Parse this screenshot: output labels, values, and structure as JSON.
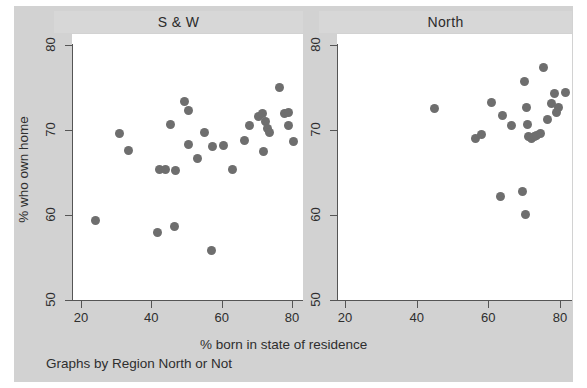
{
  "chart_data": {
    "type": "scatter",
    "title": "",
    "xlabel": "% born in state of residence",
    "ylabel": "% who own home",
    "note": "Graphs by Region North or Not",
    "xlim": [
      15,
      85
    ],
    "ylim": [
      47.5,
      82.5
    ],
    "xticks": [
      20,
      40,
      60,
      80
    ],
    "yticks": [
      50,
      60,
      70,
      80
    ],
    "grid": false,
    "legend": "none",
    "marker_color": "#6e6e6e",
    "panel_header_color": "#d7d7d7",
    "background_color": "#d2d2d2",
    "panels": [
      {
        "label": "S & W",
        "points": [
          {
            "x": 24.2,
            "y": 59.3
          },
          {
            "x": 31.0,
            "y": 69.6
          },
          {
            "x": 33.5,
            "y": 67.6
          },
          {
            "x": 41.8,
            "y": 58.0
          },
          {
            "x": 42.3,
            "y": 65.4
          },
          {
            "x": 44.0,
            "y": 65.4
          },
          {
            "x": 45.5,
            "y": 70.7
          },
          {
            "x": 46.5,
            "y": 58.6
          },
          {
            "x": 47.0,
            "y": 65.2
          },
          {
            "x": 49.3,
            "y": 73.4
          },
          {
            "x": 50.5,
            "y": 72.3
          },
          {
            "x": 50.5,
            "y": 68.3
          },
          {
            "x": 53.0,
            "y": 66.7
          },
          {
            "x": 55.0,
            "y": 69.7
          },
          {
            "x": 57.0,
            "y": 55.8
          },
          {
            "x": 57.5,
            "y": 68.1
          },
          {
            "x": 60.5,
            "y": 68.2
          },
          {
            "x": 63.0,
            "y": 65.4
          },
          {
            "x": 66.5,
            "y": 68.8
          },
          {
            "x": 68.0,
            "y": 70.5
          },
          {
            "x": 70.5,
            "y": 71.6
          },
          {
            "x": 71.5,
            "y": 71.9
          },
          {
            "x": 72.0,
            "y": 67.5
          },
          {
            "x": 72.5,
            "y": 71.0
          },
          {
            "x": 73.0,
            "y": 70.2
          },
          {
            "x": 73.5,
            "y": 69.7
          },
          {
            "x": 76.5,
            "y": 75.0
          },
          {
            "x": 78.0,
            "y": 72.0
          },
          {
            "x": 79.0,
            "y": 72.1
          },
          {
            "x": 79.0,
            "y": 70.5
          },
          {
            "x": 80.5,
            "y": 68.7
          }
        ]
      },
      {
        "label": "North",
        "points": [
          {
            "x": 45.0,
            "y": 72.5
          },
          {
            "x": 56.5,
            "y": 69.0
          },
          {
            "x": 58.0,
            "y": 69.5
          },
          {
            "x": 61.0,
            "y": 73.2
          },
          {
            "x": 63.5,
            "y": 62.2
          },
          {
            "x": 64.0,
            "y": 71.7
          },
          {
            "x": 66.5,
            "y": 70.5
          },
          {
            "x": 69.5,
            "y": 62.8
          },
          {
            "x": 70.0,
            "y": 75.7
          },
          {
            "x": 70.5,
            "y": 60.1
          },
          {
            "x": 70.6,
            "y": 72.7
          },
          {
            "x": 71.0,
            "y": 70.6
          },
          {
            "x": 71.3,
            "y": 69.2
          },
          {
            "x": 72.0,
            "y": 69.0
          },
          {
            "x": 73.0,
            "y": 69.2
          },
          {
            "x": 73.5,
            "y": 69.4
          },
          {
            "x": 74.5,
            "y": 69.6
          },
          {
            "x": 75.5,
            "y": 77.3
          },
          {
            "x": 76.5,
            "y": 71.2
          },
          {
            "x": 77.5,
            "y": 73.1
          },
          {
            "x": 78.5,
            "y": 74.3
          },
          {
            "x": 79.0,
            "y": 72.1
          },
          {
            "x": 79.5,
            "y": 72.6
          },
          {
            "x": 81.5,
            "y": 74.4
          }
        ]
      }
    ]
  }
}
